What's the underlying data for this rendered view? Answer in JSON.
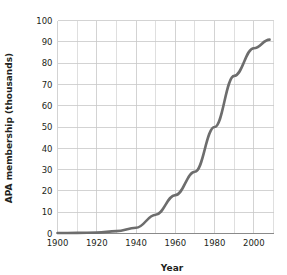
{
  "chart_data": {
    "type": "line",
    "title": "",
    "xlabel": "Year",
    "ylabel": "APA membership (thousands)",
    "xlim": [
      1900,
      2010
    ],
    "ylim": [
      0,
      100
    ],
    "grid": true,
    "legend": "none",
    "x_ticks": [
      1900,
      1920,
      1940,
      1960,
      1980,
      2000
    ],
    "x_tick_labels": [
      "1900",
      "1920",
      "1940",
      "1960",
      "1980",
      "2000"
    ],
    "x_minor_gridlines": [
      1910,
      1930,
      1950,
      1970,
      1990,
      2010
    ],
    "y_ticks": [
      0,
      10,
      20,
      30,
      40,
      50,
      60,
      70,
      80,
      90,
      100
    ],
    "y_tick_labels": [
      "0",
      "10",
      "20",
      "30",
      "40",
      "50",
      "60",
      "70",
      "80",
      "90",
      "100"
    ],
    "series": [
      {
        "name": "APA membership",
        "color": "#6d6d6d",
        "x": [
          1900,
          1910,
          1920,
          1930,
          1940,
          1950,
          1960,
          1970,
          1980,
          1990,
          2000,
          2008
        ],
        "values": [
          0.2,
          0.3,
          0.4,
          1.1,
          2.7,
          8.8,
          18.0,
          29.0,
          50.0,
          74.0,
          87.0,
          91.0
        ]
      }
    ]
  },
  "axis_titles": {
    "x": "Year",
    "y": "APA membership (thousands)"
  }
}
